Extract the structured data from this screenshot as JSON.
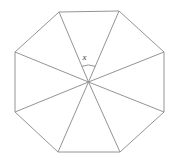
{
  "figure": {
    "angle_label": "x",
    "line_color": "#949494",
    "label_color": "#3d3d3d",
    "background": "#ffffff",
    "width": 170,
    "height": 164,
    "center": {
      "x": 88.5,
      "y": 82
    },
    "vertices": [
      {
        "x": 59,
        "y": 12
      },
      {
        "x": 119,
        "y": 11
      },
      {
        "x": 164,
        "y": 52
      },
      {
        "x": 164,
        "y": 112
      },
      {
        "x": 120,
        "y": 152
      },
      {
        "x": 58,
        "y": 152
      },
      {
        "x": 15,
        "y": 112
      },
      {
        "x": 15,
        "y": 52
      }
    ],
    "angle_arc": {
      "radius": 17,
      "between_vertex_indices": [
        0,
        1
      ]
    },
    "label_position": {
      "x": 84.5,
      "y": 60
    }
  }
}
